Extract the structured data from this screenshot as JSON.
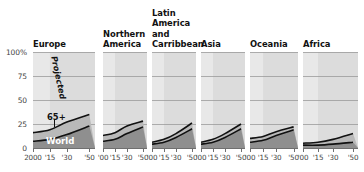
{
  "chart_data": {
    "type": "area",
    "title": "",
    "subtitle": "",
    "xlabel": "",
    "ylabel": "",
    "ylim": [
      0,
      100
    ],
    "xlim": [
      2000,
      2055
    ],
    "grid": true,
    "legend_position": "in-plot-annotations",
    "y_ticks": [
      {
        "value": 100,
        "label": "100%"
      },
      {
        "value": 75,
        "label": "75"
      },
      {
        "value": 50,
        "label": "50"
      },
      {
        "value": 25,
        "label": "25"
      },
      {
        "value": 0,
        "label": "0"
      }
    ],
    "x_ticks_first_panel": [
      "2000",
      "'15",
      "'30",
      "'50"
    ],
    "x_ticks_other_panels": [
      "'00",
      "'15",
      "'30",
      "'50"
    ],
    "x_tick_values": [
      2000,
      2015,
      2030,
      2050
    ],
    "projected_start_year": 2015,
    "annotations": [
      {
        "text": "Projected",
        "panel": "Europe",
        "note": "rotated label over shaded projection region"
      },
      {
        "text": "65+",
        "panel": "Europe",
        "note": "upper band label with leader line"
      },
      {
        "text": "World",
        "panel": "Europe",
        "note": "lower dark band label"
      }
    ],
    "series": [
      {
        "name": "65+",
        "color": "#b9b9b9"
      },
      {
        "name": "World",
        "color": "#8f8f8f"
      }
    ],
    "panels": [
      {
        "name": "Europe",
        "title_lines": [
          "Europe"
        ],
        "x": [
          2000,
          2015,
          2030,
          2050
        ],
        "values_65plus": [
          16,
          19,
          27,
          35
        ],
        "values_world": [
          7,
          9,
          14,
          23
        ]
      },
      {
        "name": "Northern America",
        "title_lines": [
          "Northern",
          "America"
        ],
        "x": [
          2000,
          2015,
          2030,
          2050
        ],
        "values_65plus": [
          13,
          16,
          23,
          28
        ],
        "values_world": [
          7,
          9,
          15,
          22
        ]
      },
      {
        "name": "Latin America and Carribbean",
        "title_lines": [
          "Latin",
          "America",
          "and",
          "Carribbean"
        ],
        "x": [
          2000,
          2015,
          2030,
          2050
        ],
        "values_65plus": [
          6,
          9,
          15,
          26
        ],
        "values_world": [
          4,
          6,
          11,
          20
        ]
      },
      {
        "name": "Asia",
        "title_lines": [
          "Asia"
        ],
        "x": [
          2000,
          2015,
          2030,
          2050
        ],
        "values_65plus": [
          6,
          9,
          15,
          25
        ],
        "values_world": [
          4,
          6,
          11,
          20
        ]
      },
      {
        "name": "Oceania",
        "title_lines": [
          "Oceania"
        ],
        "x": [
          2000,
          2015,
          2030,
          2050
        ],
        "values_65plus": [
          10,
          12,
          17,
          22
        ],
        "values_world": [
          6,
          8,
          13,
          19
        ]
      },
      {
        "name": "Africa",
        "title_lines": [
          "Africa"
        ],
        "x": [
          2000,
          2015,
          2030,
          2050
        ],
        "values_65plus": [
          5,
          6,
          9,
          15
        ],
        "values_world": [
          3,
          3,
          4,
          6
        ]
      }
    ],
    "colors": {
      "plot_background_historic": "#e8e8e8",
      "plot_background_projected": "#dcdcdc",
      "band_65plus": "#b9b9b9",
      "band_world": "#8f8f8f",
      "gridline": "#9a9a9a",
      "curve": "#111111",
      "axis": "#6f6f6f",
      "text": "#1a1a1a"
    }
  }
}
